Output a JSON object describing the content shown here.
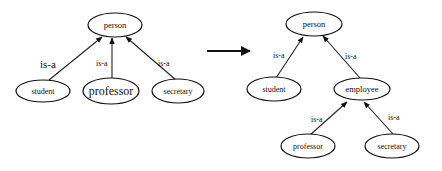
{
  "diagram": {
    "type": "is-a hierarchy transformation",
    "before": {
      "nodes": [
        {
          "id": "person",
          "label": "person"
        },
        {
          "id": "student",
          "label": "student"
        },
        {
          "id": "professor",
          "label": "professor"
        },
        {
          "id": "secretary",
          "label": "secretary"
        }
      ],
      "edges": [
        {
          "from": "student",
          "to": "person",
          "label": "is-a"
        },
        {
          "from": "professor",
          "to": "person",
          "label": "is-a"
        },
        {
          "from": "secretary",
          "to": "person",
          "label": "is-a"
        }
      ]
    },
    "transform_arrow": "right-arrow",
    "after": {
      "nodes": [
        {
          "id": "person",
          "label": "person"
        },
        {
          "id": "student",
          "label": "student"
        },
        {
          "id": "employee",
          "label": "employee"
        },
        {
          "id": "professor",
          "label": "professor"
        },
        {
          "id": "secretary",
          "label": "secretary"
        }
      ],
      "edges": [
        {
          "from": "student",
          "to": "person",
          "label": "is-a"
        },
        {
          "from": "employee",
          "to": "person",
          "label": "is-a"
        },
        {
          "from": "professor",
          "to": "employee",
          "label": "is-a"
        },
        {
          "from": "secretary",
          "to": "employee",
          "label": "is-a"
        }
      ]
    }
  }
}
